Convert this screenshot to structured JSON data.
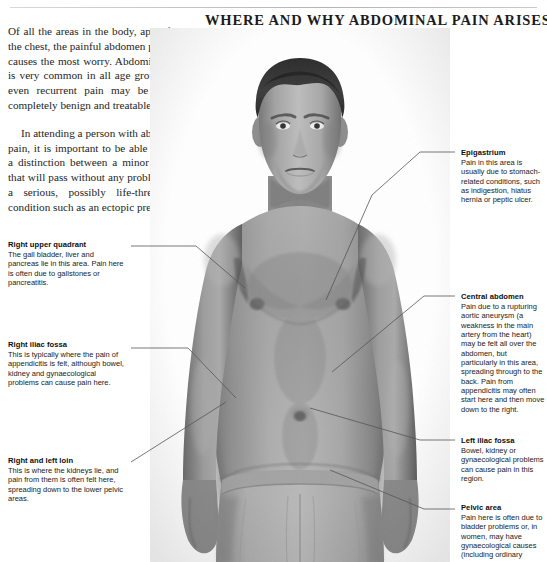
{
  "page": {
    "headline": "WHERE AND WHY ABDOMINAL PAIN ARISES",
    "background_color": "#ffffff",
    "text_color": "#1a1a1a",
    "leader_line_color": "#555555"
  },
  "intro": {
    "paragraph_1": "Of all the areas in the body, apart from the chest, the painful abdomen probably causes the most worry. Abdominal pain is very common in all age groups, and even recurrent pain may be due to completely benign and treatable causes.",
    "paragraph_2": "In attending a person with abdominal pain, it is important to be able to make a distinction between a minor episode that will pass without any problems and a serious, possibly life-threatening, condition such as an ectopic pregnancy."
  },
  "figure": {
    "alt": "anatomical-photo-male-torso"
  },
  "callouts": {
    "left": [
      {
        "id": "right-upper-quadrant",
        "title": "Right upper quadrant",
        "body": "The gall bladder, liver and pancreas lie in this area. Pain here is often due to gallstones or pancreatitis."
      },
      {
        "id": "right-iliac-fossa",
        "title": "Right iliac fossa",
        "body": "This is typically where the pain of appendicitis is felt, although bowel, kidney and gynaecological problems can cause pain here."
      },
      {
        "id": "right-and-left-loin",
        "title": "Right and left loin",
        "body": "This is where the kidneys lie, and pain from them is often felt here, spreading down to the lower pelvic areas."
      }
    ],
    "right": [
      {
        "id": "epigastrium",
        "title": "Epigastrium",
        "body": "Pain in this area is usually due to stomach-related conditions, such as indigestion, hiatus hernia or peptic ulcer."
      },
      {
        "id": "central-abdomen",
        "title": "Central abdomen",
        "body": "Pain due to a rupturing aortic aneurysm (a weakness in the main artery from the heart) may be felt all over the abdomen, but particularly in this area, spreading through to the back. Pain from appendicitis may often start here and then move down to the right."
      },
      {
        "id": "left-iliac-fossa",
        "title": "Left iliac fossa",
        "body": "Bowel, kidney or gynaecological problems can cause pain in this region."
      },
      {
        "id": "pelvic-area",
        "title": "Pelvic area",
        "body": "Pain here is often due to bladder problems or, in women, may have gynaecological causes (including ordinary"
      }
    ]
  }
}
